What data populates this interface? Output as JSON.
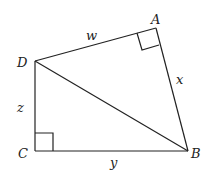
{
  "diagram": {
    "type": "quadrilateral with diagonal",
    "vertices": {
      "A": {
        "label": "A",
        "x": 156,
        "y": 28
      },
      "B": {
        "label": "B",
        "x": 188,
        "y": 151
      },
      "C": {
        "label": "C",
        "x": 35,
        "y": 151
      },
      "D": {
        "label": "D",
        "x": 35,
        "y": 61
      }
    },
    "sides": [
      {
        "from": "D",
        "to": "A",
        "label": "w"
      },
      {
        "from": "A",
        "to": "B",
        "label": "x"
      },
      {
        "from": "C",
        "to": "B",
        "label": "y"
      },
      {
        "from": "D",
        "to": "C",
        "label": "z"
      },
      {
        "from": "D",
        "to": "B",
        "label": ""
      }
    ],
    "right_angles": [
      "A",
      "C"
    ]
  }
}
